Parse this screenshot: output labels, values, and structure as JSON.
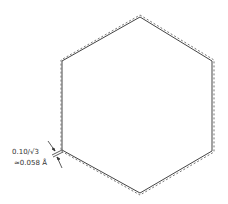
{
  "diagram": {
    "type": "hexagon-offset-outline",
    "colors": {
      "solid_line": "#444444",
      "dashed_line": "#777777",
      "text": "#333333",
      "background": "#ffffff"
    },
    "hexagon_solid": {
      "vertices": [
        [
          140,
          17
        ],
        [
          212,
          61
        ],
        [
          212,
          151
        ],
        [
          140,
          193
        ],
        [
          62,
          150
        ],
        [
          62,
          61
        ]
      ]
    },
    "hexagon_dashed": {
      "vertices": [
        [
          140,
          15
        ],
        [
          214,
          60
        ],
        [
          214,
          152
        ],
        [
          140,
          195
        ],
        [
          61,
          151
        ],
        [
          61,
          60
        ]
      ]
    },
    "annotation": {
      "line1": "0.10/√3",
      "line2": "≈0.058 Å"
    }
  }
}
